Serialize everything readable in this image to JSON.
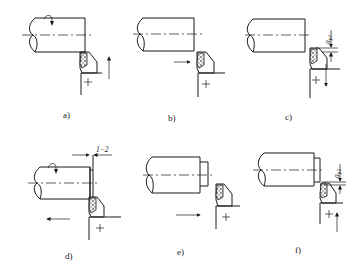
{
  "figure": {
    "panels": [
      {
        "id": "a",
        "label": "a)",
        "tool_motion": "up",
        "spindle": "rotating"
      },
      {
        "id": "b",
        "label": "b)",
        "tool_motion": "right",
        "spindle": "stationary"
      },
      {
        "id": "c",
        "label": "c)",
        "tool_motion": "down",
        "dimension": "a_p1"
      },
      {
        "id": "d",
        "label": "d)",
        "tool_motion": "left",
        "spindle": "rotating",
        "dimension": "1~2"
      },
      {
        "id": "e",
        "label": "e)",
        "tool_motion": "right",
        "spindle": "stationary"
      },
      {
        "id": "f",
        "label": "f)",
        "tool_motion": "up",
        "dimension": "a_p2"
      }
    ],
    "dimensions": {
      "ap1": "a",
      "ap1_sub": "p1",
      "ap2": "a",
      "ap2_sub": "p2",
      "offset": "1−2"
    },
    "colors": {
      "line": "#1a1a1a",
      "background": "#ffffff"
    }
  }
}
